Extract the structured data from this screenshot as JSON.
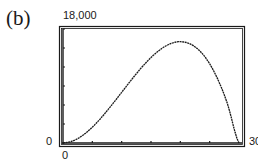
{
  "panel": {
    "label": "(b)"
  },
  "chart_data": {
    "type": "line",
    "title": "",
    "xlabel": "",
    "ylabel": "",
    "xlim": [
      0,
      30
    ],
    "ylim": [
      0,
      18000
    ],
    "x_tick_labels": [
      "0",
      "30"
    ],
    "y_tick_labels": [
      "0",
      "18,000"
    ],
    "x_ticks": [
      0,
      5,
      10,
      15,
      20,
      25,
      30
    ],
    "y_ticks": [
      0,
      3000,
      6000,
      9000,
      12000,
      15000,
      18000
    ],
    "grid": false,
    "legend": null,
    "series": [
      {
        "name": "curve",
        "x": [
          0,
          2,
          4,
          6,
          8,
          10,
          12,
          14,
          16,
          18,
          20,
          22,
          24,
          26,
          28,
          30
        ],
        "y": [
          0,
          448,
          1664,
          3456,
          5632,
          8000,
          10368,
          12544,
          14336,
          15552,
          16000,
          15488,
          13824,
          10816,
          6272,
          0
        ]
      }
    ],
    "annotations": []
  },
  "axes": {
    "y_max_label": "18,000",
    "y_min_label": "0",
    "x_min_label": "0",
    "x_max_label": "30"
  },
  "colors": {
    "ink": "#1a1a1a",
    "background": "#ffffff"
  }
}
